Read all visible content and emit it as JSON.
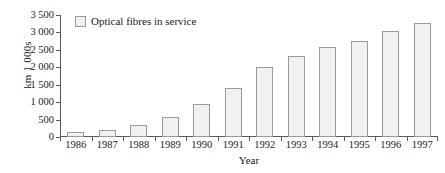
{
  "chart_data": {
    "type": "bar",
    "title": "",
    "subtitle": "",
    "xlabel": "Year",
    "ylabel": "km 1 000s",
    "categories": [
      "1986",
      "1987",
      "1988",
      "1989",
      "1990",
      "1991",
      "1992",
      "1993",
      "1994",
      "1995",
      "1996",
      "1997"
    ],
    "values": [
      140,
      200,
      345,
      580,
      950,
      1420,
      2020,
      2320,
      2570,
      2750,
      3030,
      3270
    ],
    "series": [
      {
        "name": "Optical fibres in service",
        "values": [
          140,
          200,
          345,
          580,
          950,
          1420,
          2020,
          2320,
          2570,
          2750,
          3030,
          3270
        ]
      }
    ],
    "ylim": [
      0,
      3500
    ],
    "ytick_values": [
      0,
      500,
      1000,
      1500,
      2000,
      2500,
      3000,
      3500
    ],
    "ytick_labels": [
      "0",
      "500",
      "1 000",
      "1 500",
      "2 000",
      "2 500",
      "3 000",
      "3 500"
    ],
    "grid": false,
    "legend": {
      "position": "top-left-inside",
      "entries": [
        "Optical fibres in service"
      ]
    },
    "colors": {
      "bar_fill": "#f1f1ef",
      "bar_border": "#9a9a9a",
      "axis": "#5a5a5a",
      "text": "#1a1a1a",
      "background": "#ffffff"
    }
  }
}
